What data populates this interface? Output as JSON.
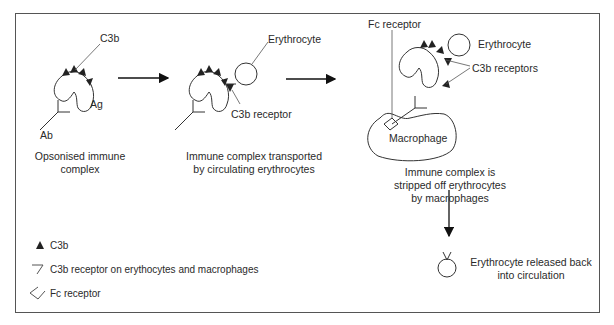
{
  "diagram": {
    "stage1": {
      "labels": {
        "c3b": "C3b",
        "ag": "Ag",
        "ab": "Ab"
      },
      "caption": [
        "Opsonised immune",
        "complex"
      ]
    },
    "stage2": {
      "labels": {
        "erythrocyte": "Erythrocyte",
        "c3b_receptor": "C3b receptor"
      },
      "caption": [
        "Immune complex transported",
        "by circulating erythrocytes"
      ]
    },
    "stage3": {
      "labels": {
        "fc_receptor": "Fc receptor",
        "erythrocyte": "Erythrocyte",
        "c3b_receptors": "C3b receptors",
        "macrophage": "Macrophage"
      },
      "caption": [
        "Immune complex is",
        "stripped off erythrocytes",
        "by macrophages"
      ]
    },
    "stage4": {
      "caption": [
        "Erythrocyte released back",
        "into circulation"
      ]
    },
    "legend": [
      {
        "icon": "filled-triangle-icon",
        "label": "C3b"
      },
      {
        "icon": "c3b-receptor-icon",
        "label": "C3b receptor on erythocytes and macrophages"
      },
      {
        "icon": "fc-receptor-icon",
        "label": "Fc receptor"
      }
    ]
  }
}
